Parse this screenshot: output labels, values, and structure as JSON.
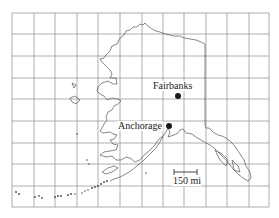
{
  "map": {
    "region": "Alaska",
    "cities": [
      {
        "name": "Fairbanks",
        "label_x": 152,
        "label_y": 81,
        "dot_x": 178,
        "dot_y": 96
      },
      {
        "name": "Anchorage",
        "label_x": 117,
        "label_y": 121,
        "dot_x": 169,
        "dot_y": 126
      }
    ],
    "scale_bar": {
      "label": "150 mi"
    },
    "colors": {
      "grid": "#9a9a9a",
      "coast": "#555555",
      "background": "#ffffff",
      "dot": "#1a1a1a"
    }
  }
}
